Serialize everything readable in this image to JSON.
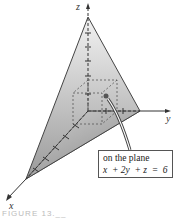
{
  "figure": {
    "axes": {
      "x_label": "x",
      "y_label": "y",
      "z_label": "z"
    },
    "callout": {
      "line1": "on the plane",
      "line2": "x  + 2y  + z  =  6"
    },
    "caption": "FIGURE 13.__"
  },
  "colors": {
    "plane_light": "#eeeeee",
    "plane_dark": "#8a8a8a",
    "edge": "#444444",
    "axis": "#333333"
  }
}
